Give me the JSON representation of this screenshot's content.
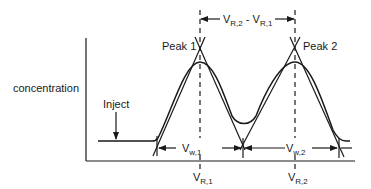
{
  "diagram": {
    "type": "chromatogram-resolution-diagram",
    "y_axis_label": "concentration",
    "inject_label": "Inject",
    "peaks": [
      {
        "label": "Peak 1",
        "retention_label": "V",
        "retention_sub": "R,1",
        "width_label": "V",
        "width_sub": "w,1"
      },
      {
        "label": "Peak 2",
        "retention_label": "V",
        "retention_sub": "R,2",
        "width_label": "V",
        "width_sub": "w,2"
      }
    ],
    "separation_label": {
      "part1": "V",
      "sub1": "R,2",
      "minus": " - ",
      "part2": "V",
      "sub2": "R,1"
    },
    "colors": {
      "line": "#1a1a1a",
      "background": "#ffffff"
    }
  }
}
